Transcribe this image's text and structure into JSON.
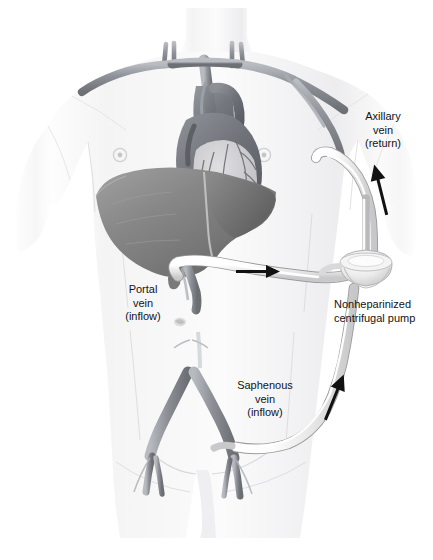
{
  "figure": {
    "background_color": "#ffffff",
    "ink_color": "#141414",
    "tube_color": "#f2f2f2",
    "vessel_color": "#8f9398",
    "organ_color": "#8a8a8a",
    "skin_color": "#f7f7f8"
  },
  "labels": {
    "axillary": {
      "lines": [
        "Axillary",
        "vein",
        "(return)"
      ],
      "align": "center",
      "x": 340,
      "y": 110
    },
    "portal": {
      "lines": [
        "Portal",
        "vein",
        "(inflow)"
      ],
      "align": "center",
      "x": 108,
      "y": 283
    },
    "pump": {
      "lines": [
        "Nonheparinized",
        "centrifugal pump"
      ],
      "align": "left",
      "x": 334,
      "y": 298
    },
    "saphenous": {
      "lines": [
        "Saphenous",
        "vein",
        "(inflow)"
      ],
      "align": "center",
      "x": 224,
      "y": 379
    }
  },
  "anatomy": {
    "organs": [
      {
        "name": "heart",
        "shade": "#6f7278"
      },
      {
        "name": "liver",
        "shade": "#8a8a8a"
      },
      {
        "name": "inferior-vena-cava",
        "shade": "#9a9ea3"
      },
      {
        "name": "iliac-veins",
        "shade": "#9a9ea3"
      },
      {
        "name": "subclavian-veins",
        "shade": "#8d9196"
      },
      {
        "name": "jugular-veins",
        "shade": "#8d9196"
      },
      {
        "name": "portal-vein",
        "shade": "#8d9196"
      },
      {
        "name": "femoral-veins",
        "shade": "#9a9ea3"
      }
    ]
  },
  "circuit": {
    "device": {
      "name": "centrifugal-pump",
      "shape": "cone-with-shaft"
    },
    "lines": [
      {
        "name": "portal-inflow-tube",
        "from": "portal vein",
        "to": "pump"
      },
      {
        "name": "saphenous-inflow-tube",
        "from": "saphenous vein",
        "to": "pump"
      },
      {
        "name": "axillary-return-tube",
        "from": "pump",
        "to": "axillary vein"
      }
    ],
    "flow_arrows": [
      {
        "name": "arrow-portal-flow",
        "x": 255,
        "y": 270,
        "angle": 0
      },
      {
        "name": "arrow-return-flow",
        "x": 379,
        "y": 190,
        "angle": -78
      },
      {
        "name": "arrow-saphenous-flow",
        "x": 335,
        "y": 396,
        "angle": -68
      }
    ]
  }
}
